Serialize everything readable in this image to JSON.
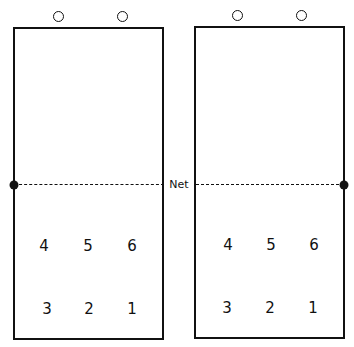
{
  "diagram": {
    "net_label": "Net",
    "courts": [
      {
        "name": "left",
        "front_row": [
          "4",
          "5",
          "6"
        ],
        "back_row": [
          "3",
          "2",
          "1"
        ],
        "markers_above": 2
      },
      {
        "name": "right",
        "front_row": [
          "4",
          "5",
          "6"
        ],
        "back_row": [
          "3",
          "2",
          "1"
        ],
        "markers_above": 2
      }
    ]
  }
}
